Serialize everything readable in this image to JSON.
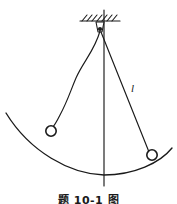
{
  "figure": {
    "caption": "题 10-1 图",
    "background_color": "#ffffff",
    "ink_color": "#1a1a1a",
    "labels": [
      {
        "id": "cord-length",
        "text": "l",
        "x": 131,
        "y": 92
      }
    ],
    "support": {
      "name": "ceiling-hatching",
      "line_x1": 80,
      "line_x2": 120,
      "line_y": 21,
      "hatch_count": 7,
      "hatch_length": 7
    },
    "pivot": {
      "name": "pivot-point",
      "x": 100,
      "y": 29,
      "radius": 2.2
    },
    "bobs": [
      {
        "id": "left-bob",
        "label": "displaced bob",
        "x": 51,
        "y": 131,
        "radius": 5.2
      },
      {
        "id": "right-bob",
        "label": "bob on arc",
        "x": 152,
        "y": 155,
        "radius": 5.2
      }
    ],
    "cords": [
      {
        "id": "left-cord",
        "label": "slack curved cord",
        "type": "curve",
        "path": "M 100 31 C 95 50, 83 62, 76 78 C 70 92, 68 100, 60 115 C 57 121, 54 126, 52 128"
      },
      {
        "id": "right-cord",
        "label": "taut straight cord of length l",
        "type": "line",
        "x1": 101,
        "y1": 32,
        "x2": 149,
        "y2": 152
      }
    ],
    "vertical_axis": {
      "id": "vertical-reference-line",
      "x": 104,
      "y1": 10,
      "y2": 186
    },
    "arc": {
      "id": "swing-arc",
      "label": "trajectory arc",
      "path": "M 6 113 C 30 152, 70 174, 104 175 C 134 175, 160 163, 172 148"
    }
  }
}
